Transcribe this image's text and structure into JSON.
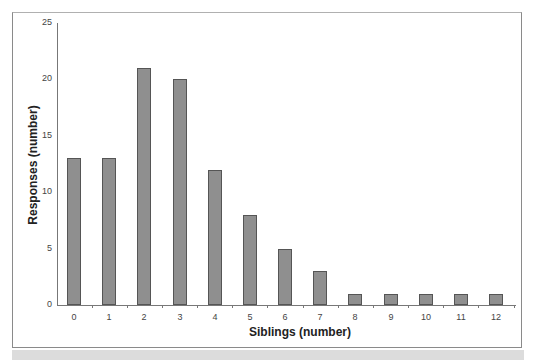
{
  "chart_data": {
    "type": "bar",
    "title": "",
    "xlabel": "Siblings (number)",
    "ylabel": "Responses (number)",
    "categories": [
      "0",
      "1",
      "2",
      "3",
      "4",
      "5",
      "6",
      "7",
      "8",
      "9",
      "10",
      "11",
      "12"
    ],
    "values": [
      13,
      13,
      21,
      20,
      12,
      8,
      5,
      3,
      1,
      1,
      1,
      1,
      1
    ],
    "ylim": [
      0,
      25
    ],
    "yticks": [
      "0",
      "5",
      "10",
      "15",
      "20",
      "25"
    ],
    "grid": false,
    "legend": null,
    "bar_color": "#8f8f8f"
  }
}
